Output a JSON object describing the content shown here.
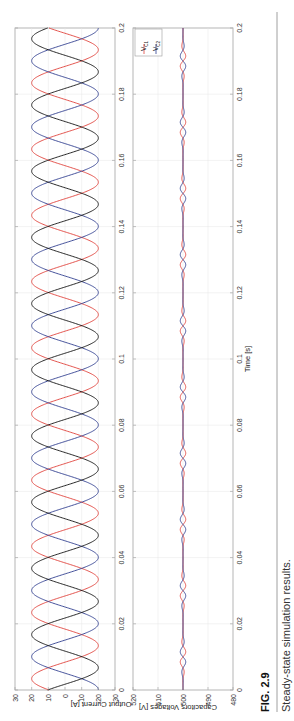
{
  "chart_data": [
    {
      "type": "line",
      "title": "",
      "xlabel": "",
      "ylabel": "Output Current [A]",
      "xlim": [
        0,
        0.2
      ],
      "ylim": [
        -30,
        30
      ],
      "xticks": [
        "0",
        "0.02",
        "0.04",
        "0.06",
        "0.08",
        "0.1",
        "0.12",
        "0.14",
        "0.16",
        "0.18",
        "0.2"
      ],
      "yticks": [
        "30",
        "20",
        "10",
        "0",
        "-10",
        "-20",
        "-30"
      ],
      "grid": true,
      "frequency_hz": 50,
      "series": [
        {
          "name": "Phase a",
          "color": "#e0413a",
          "amplitude": 20,
          "phase_deg": 0
        },
        {
          "name": "Phase b",
          "color": "#2f3d8f",
          "amplitude": 20,
          "phase_deg": -120
        },
        {
          "name": "Phase c",
          "color": "#111111",
          "amplitude": 20,
          "phase_deg": 120
        }
      ]
    },
    {
      "type": "line",
      "title": "",
      "xlabel": "Time [s]",
      "ylabel": "Capacitors Voltages [V]",
      "xlim": [
        0,
        0.2
      ],
      "ylim": [
        480,
        520
      ],
      "xticks": [
        "0",
        "0.02",
        "0.04",
        "0.06",
        "0.08",
        "0.1",
        "0.12",
        "0.14",
        "0.16",
        "0.18",
        "0.2"
      ],
      "yticks": [
        "520",
        "510",
        "500",
        "490",
        "480"
      ],
      "grid": true,
      "legend_position": "upper left",
      "series": [
        {
          "name": "V_C1",
          "color": "#e0413a",
          "nominal": 500,
          "ripple_amplitude": 1.2
        },
        {
          "name": "V_C2",
          "color": "#2f3d8f",
          "nominal": 500,
          "ripple_amplitude": 1.2
        }
      ]
    }
  ],
  "plot1": {
    "ylabel": "Output Current [A]",
    "yticks": [
      "30",
      "20",
      "10",
      "0",
      "-10",
      "-20",
      "-30"
    ]
  },
  "plot2": {
    "ylabel": "Capacitors Voltages [V]",
    "xlabel": "Time [s]",
    "yticks": [
      "520",
      "510",
      "500",
      "490",
      "480"
    ],
    "legend": [
      {
        "label": "V",
        "sub": "C1",
        "color": "#e0413a"
      },
      {
        "label": "V",
        "sub": "C2",
        "color": "#2f3d8f"
      }
    ]
  },
  "xticks": [
    "0",
    "0.02",
    "0.04",
    "0.06",
    "0.08",
    "0.1",
    "0.12",
    "0.14",
    "0.16",
    "0.18",
    "0.2"
  ],
  "caption": {
    "label": "FIG. 2.9",
    "text": "Steady-state simulation results."
  },
  "colors": {
    "red": "#e0413a",
    "blue": "#2f3d8f",
    "black": "#111111",
    "axis": "#9a9a9a",
    "grid": "#e6e6e6"
  }
}
